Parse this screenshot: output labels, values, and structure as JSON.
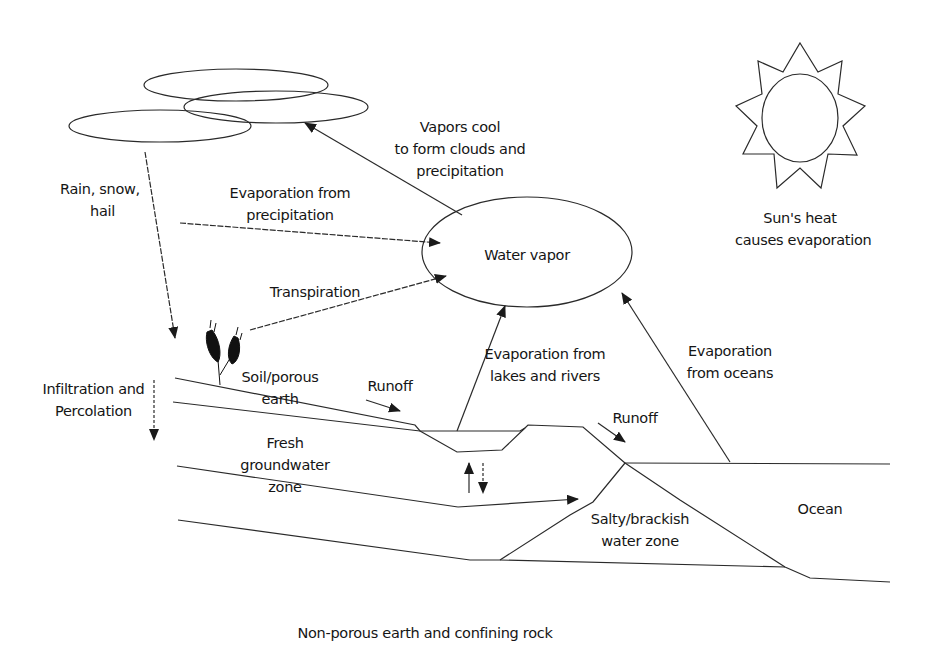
{
  "diagram": {
    "labels": {
      "vapors_cool": [
        "Vapors cool",
        "to form clouds and",
        "precipitation"
      ],
      "rain": [
        "Rain, snow,",
        "hail"
      ],
      "evap_precip": [
        "Evaporation from",
        "precipitation"
      ],
      "water_vapor": "Water vapor",
      "sun": [
        "Sun's heat",
        "causes evaporation"
      ],
      "transpiration": "Transpiration",
      "soil": [
        "Soil/porous",
        "earth"
      ],
      "runoff_left": "Runoff",
      "runoff_right": "Runoff",
      "evap_lakes": [
        "Evaporation from",
        "lakes and rivers"
      ],
      "evap_oceans": [
        "Evaporation",
        "from oceans"
      ],
      "infiltration": [
        "Infiltration and",
        "Percolation"
      ],
      "fresh_groundwater": [
        "Fresh",
        "groundwater",
        "zone"
      ],
      "salty_zone": [
        "Salty/brackish",
        "water zone"
      ],
      "ocean": "Ocean",
      "bedrock": "Non-porous earth and confining rock"
    },
    "colors": {
      "line": "#2a2a2a",
      "text": "#151515",
      "background": "#ffffff"
    }
  }
}
